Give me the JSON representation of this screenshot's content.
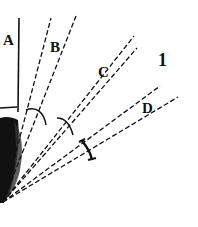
{
  "figure": {
    "panel_number": "1",
    "labels": {
      "a": "A",
      "b": "B",
      "c": "C",
      "d": "D"
    },
    "colors": {
      "ink": "#111111",
      "background": "#ffffff"
    }
  }
}
